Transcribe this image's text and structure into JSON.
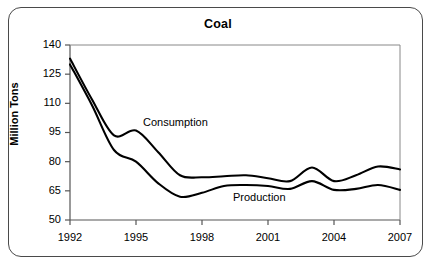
{
  "figure": {
    "title": "Coal",
    "y_axis_title": "Million Tons"
  },
  "annotations": {
    "consumption_label": "Consumption",
    "production_label": "Production"
  },
  "axes": {
    "y_ticks": [
      "140",
      "125",
      "110",
      "95",
      "80",
      "65",
      "50"
    ],
    "x_ticks": [
      "1992",
      "1995",
      "1998",
      "2001",
      "2004",
      "2007"
    ]
  },
  "colors": {
    "line": "#000000",
    "frame": "#4a4a4a",
    "background": "#ffffff"
  },
  "chart_data": {
    "type": "line",
    "title": "Coal",
    "xlabel": "",
    "ylabel": "Million Tons",
    "xlim": [
      1992,
      2007
    ],
    "ylim": [
      50,
      140
    ],
    "yticks": [
      50,
      65,
      80,
      95,
      110,
      125,
      140
    ],
    "xticks": [
      1992,
      1995,
      1998,
      2001,
      2004,
      2007
    ],
    "grid": false,
    "legend": "inline-annotations",
    "x": [
      1992,
      1993,
      1994,
      1995,
      1996,
      1997,
      1998,
      1999,
      2000,
      2001,
      2002,
      2003,
      2004,
      2005,
      2006,
      2007
    ],
    "series": [
      {
        "name": "Consumption",
        "values": [
          133,
          112,
          93.5,
          96,
          85,
          73,
          72,
          72.5,
          73,
          71.5,
          70,
          77,
          70,
          73,
          77.5,
          76
        ]
      },
      {
        "name": "Production",
        "values": [
          130,
          109,
          86,
          80,
          69,
          62,
          64,
          67.5,
          68,
          67.5,
          66,
          70,
          65.5,
          66,
          68,
          65.5
        ]
      }
    ]
  }
}
